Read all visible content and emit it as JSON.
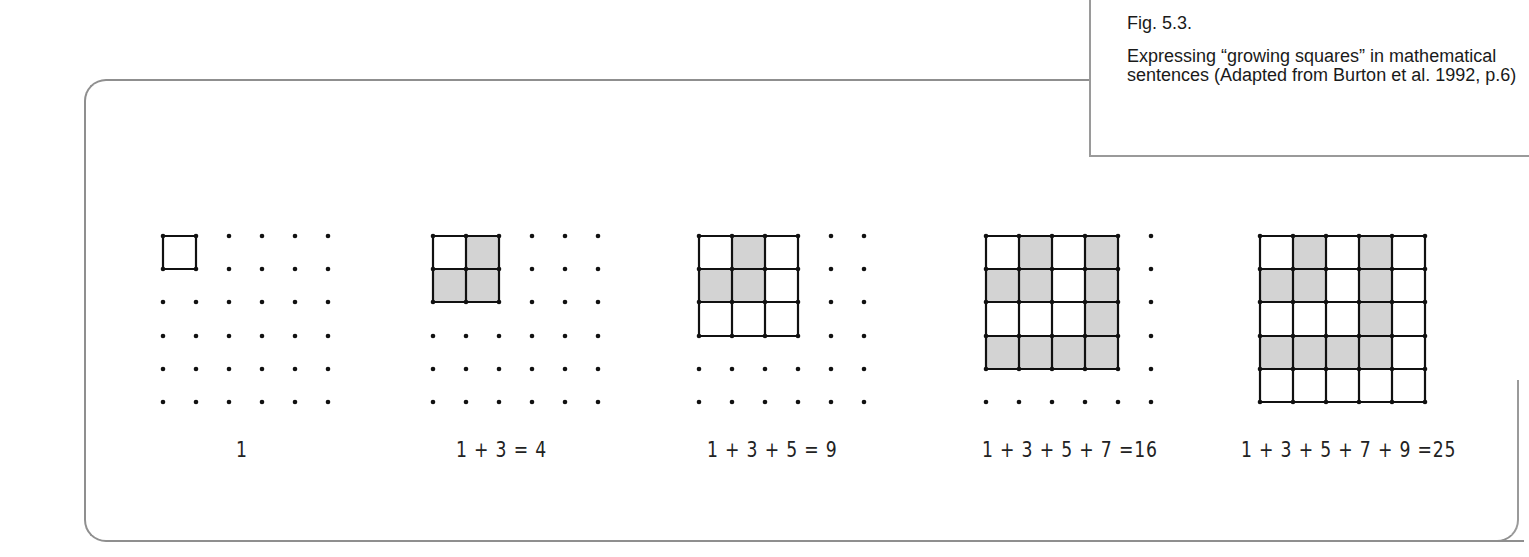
{
  "caption": {
    "figure_number": "Fig. 5.3.",
    "description": "Expressing “growing squares” in mathematical sentences (Adapted from Burton et al. 1992, p.6)"
  },
  "colors": {
    "frame": "#8f8f8f",
    "shade": "#d3d3d3",
    "line": "#111111"
  },
  "grid": {
    "dots_per_side": 6,
    "row_y": [
      236,
      269,
      302,
      336,
      369,
      402
    ],
    "spacing_px": 33
  },
  "panels": [
    {
      "label": "1",
      "origin_x": 163,
      "square_size": 1,
      "shaded_cells": []
    },
    {
      "label": "1 + 3 = 4",
      "origin_x": 433,
      "square_size": 2,
      "shaded_cells": [
        [
          0,
          1
        ],
        [
          1,
          0
        ],
        [
          1,
          1
        ]
      ]
    },
    {
      "label": "1 + 3 + 5 = 9",
      "origin_x": 699,
      "square_size": 3,
      "shaded_cells": [
        [
          0,
          1
        ],
        [
          1,
          0
        ],
        [
          1,
          1
        ]
      ]
    },
    {
      "label": "1 + 3 + 5 + 7 =16",
      "origin_x": 986,
      "square_size": 4,
      "shaded_cells": [
        [
          0,
          1
        ],
        [
          1,
          0
        ],
        [
          1,
          1
        ],
        [
          0,
          3
        ],
        [
          1,
          3
        ],
        [
          2,
          3
        ],
        [
          3,
          0
        ],
        [
          3,
          1
        ],
        [
          3,
          2
        ],
        [
          3,
          3
        ]
      ]
    },
    {
      "label": "1 + 3 + 5 + 7 + 9 =25",
      "origin_x": 1260,
      "square_size": 5,
      "shaded_cells": [
        [
          0,
          1
        ],
        [
          1,
          0
        ],
        [
          1,
          1
        ],
        [
          0,
          3
        ],
        [
          1,
          3
        ],
        [
          2,
          3
        ],
        [
          3,
          0
        ],
        [
          3,
          1
        ],
        [
          3,
          2
        ],
        [
          3,
          3
        ]
      ]
    }
  ],
  "label_positions_x": [
    236,
    456,
    707,
    982,
    1241
  ]
}
